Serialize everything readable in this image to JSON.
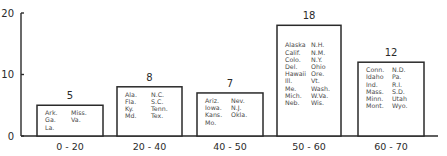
{
  "chart_data": {
    "type": "bar",
    "title": "",
    "xlabel": "",
    "ylabel": "",
    "ylim": [
      0,
      20
    ],
    "yticks": [
      "0",
      "10",
      "20"
    ],
    "grid": false,
    "categories": [
      "0 - 20",
      "20 - 40",
      "40 - 50",
      "50 - 60",
      "60 - 70"
    ],
    "values": [
      5,
      8,
      7,
      18,
      12
    ],
    "value_labels": [
      "5",
      "8",
      "7",
      "18",
      "12"
    ],
    "bar_annotations": [
      {
        "col1": [
          "Ark.",
          "Ga.",
          "La."
        ],
        "col2": [
          "Miss.",
          "Va."
        ]
      },
      {
        "col1": [
          "Ala.",
          "Fla.",
          "Ky.",
          "Md."
        ],
        "col2": [
          "N.C.",
          "S.C.",
          "Tenn.",
          "Tex."
        ]
      },
      {
        "col1": [
          "Ariz.",
          "Iowa.",
          "Kans.",
          "Mo."
        ],
        "col2": [
          "Nev.",
          "N.J.",
          "Okla."
        ]
      },
      {
        "col1": [
          "Alaska",
          "Calif.",
          "Colo.",
          "Del.",
          "Hawaii",
          "Ill.",
          "Me.",
          "Mich.",
          "Neb."
        ],
        "col2": [
          "N.H.",
          "N.M.",
          "N.Y.",
          "Ohio",
          "Ore.",
          "Vt.",
          "Wash.",
          "W.Va.",
          "Wis."
        ]
      },
      {
        "col1": [
          "Conn.",
          "Idaho",
          "Ind.",
          "Mass.",
          "Minn.",
          "Mont."
        ],
        "col2": [
          "N.D.",
          "Pa.",
          "R.I.",
          "S.D.",
          "Utah",
          "Wyo."
        ]
      }
    ]
  }
}
